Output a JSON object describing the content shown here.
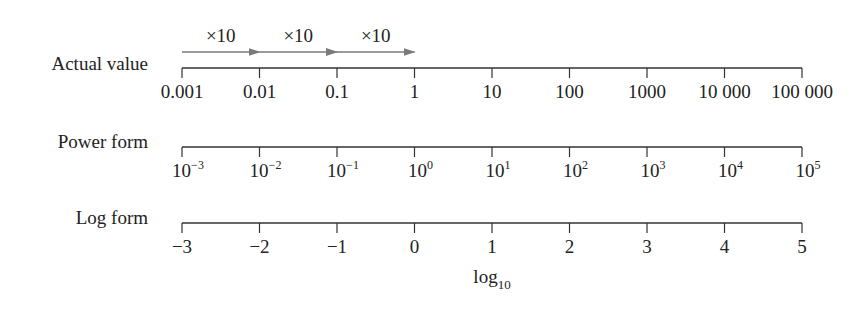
{
  "rows": [
    {
      "label": "Actual value",
      "ticks": [
        "0.001",
        "0.01",
        "0.1",
        "1",
        "10",
        "100",
        "1000",
        "10 000",
        "100 000"
      ]
    },
    {
      "label": "Power form",
      "ticks": [
        {
          "base": "10",
          "exp": "−3"
        },
        {
          "base": "10",
          "exp": "−2"
        },
        {
          "base": "10",
          "exp": "−1"
        },
        {
          "base": "10",
          "exp": "0"
        },
        {
          "base": "10",
          "exp": "1"
        },
        {
          "base": "10",
          "exp": "2"
        },
        {
          "base": "10",
          "exp": "3"
        },
        {
          "base": "10",
          "exp": "4"
        },
        {
          "base": "10",
          "exp": "5"
        }
      ]
    },
    {
      "label": "Log form",
      "ticks": [
        "−3",
        "−2",
        "−1",
        "0",
        "1",
        "2",
        "3",
        "4",
        "5"
      ]
    }
  ],
  "arrows": [
    {
      "label": "×10"
    },
    {
      "label": "×10"
    },
    {
      "label": "×10"
    }
  ],
  "axis_caption": {
    "base": "log",
    "sub": "10"
  },
  "colors": {
    "arrow": "#7a7a7a",
    "axis": "#333333",
    "text": "#222222"
  }
}
